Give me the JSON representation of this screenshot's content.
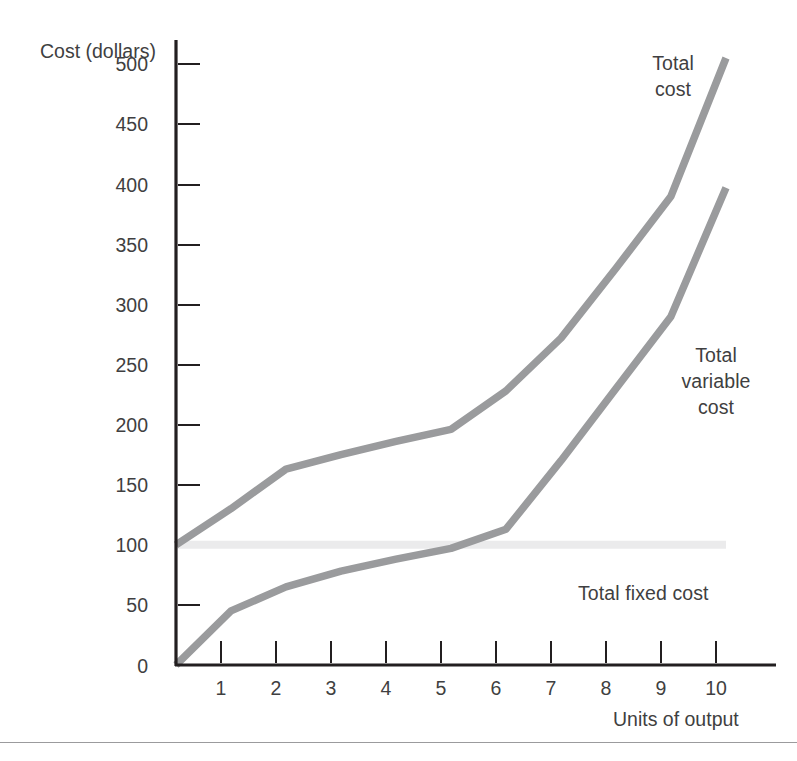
{
  "axis_titles": {
    "y": "Cost\n(dollars)",
    "x": "Units of output"
  },
  "annotations": {
    "total_cost": "Total\ncost",
    "total_variable_cost": "Total\nvariable\ncost",
    "total_fixed_cost": "Total fixed cost"
  },
  "colors": {
    "curve": "#9a9b9d",
    "fixed_line": "#ebebec",
    "axis": "#231f20",
    "text": "#3f3f41",
    "background": "#ffffff",
    "rule": "#9b9b9d"
  },
  "chart_data": {
    "type": "line",
    "title": "",
    "xlabel": "Units of output",
    "ylabel": "Cost (dollars)",
    "xlim": [
      0,
      11
    ],
    "ylim": [
      0,
      525
    ],
    "grid": false,
    "legend": "inline annotations",
    "x": [
      0,
      1,
      2,
      3,
      4,
      5,
      6,
      7,
      8,
      9,
      10
    ],
    "yticks": [
      0,
      50,
      100,
      150,
      200,
      250,
      300,
      350,
      400,
      450,
      500
    ],
    "xticks": [
      1,
      2,
      3,
      4,
      5,
      6,
      7,
      8,
      9,
      10
    ],
    "series": [
      {
        "name": "Total cost",
        "values": [
          100,
          130,
          163,
          175,
          186,
          196,
          228,
          272,
          330,
          390,
          505
        ]
      },
      {
        "name": "Total variable cost",
        "values": [
          0,
          45,
          65,
          78,
          88,
          97,
          113,
          170,
          230,
          290,
          397
        ]
      },
      {
        "name": "Total fixed cost",
        "values": [
          100,
          100,
          100,
          100,
          100,
          100,
          100,
          100,
          100,
          100,
          100
        ]
      }
    ]
  }
}
